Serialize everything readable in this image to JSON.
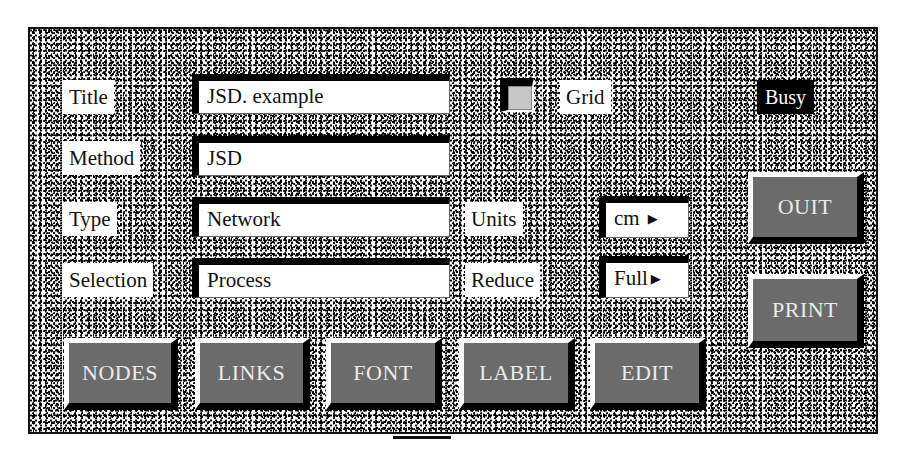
{
  "form": {
    "fields": [
      {
        "label": "Title",
        "value": "JSD. example"
      },
      {
        "label": "Method",
        "value": "JSD"
      },
      {
        "label": "Type",
        "value": "Network"
      },
      {
        "label": "Selection",
        "value": "Process"
      }
    ],
    "grid": {
      "label": "Grid",
      "checked": false
    },
    "status": {
      "label": "Busy"
    },
    "units": {
      "label": "Units",
      "value": "cm",
      "arrow": "▶"
    },
    "reduce": {
      "label": "Reduce",
      "value": "Full",
      "arrow": "▶"
    }
  },
  "buttons": {
    "quit": "OUIT",
    "print": "PRINT",
    "nodes": "NODES",
    "links": "LINKS",
    "font": "FONT",
    "label": "LABEL",
    "edit": "EDIT"
  },
  "colors": {
    "button_bg": "#6b6b6b",
    "button_text": "#eaeaea",
    "busy_bg": "#000000",
    "checkbox_fill": "#c6c6c6"
  }
}
